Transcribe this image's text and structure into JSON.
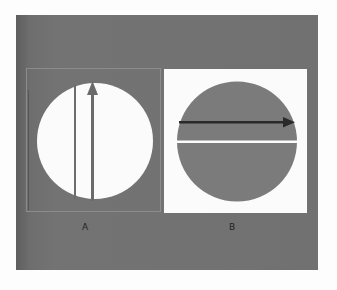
{
  "figure": {
    "colors": {
      "plate": "#6f6f6f",
      "panel_a_circle": "#fbfbfb",
      "panel_b_background": "#fbfbfb",
      "panel_b_circle": "#7a7a7a",
      "arrow_a": "#6a6a6a",
      "arrow_b": "#2a2a2a",
      "divider_b": "#fbfbfb"
    },
    "panels": [
      {
        "label": "A",
        "background": "gray",
        "circle_fill": "white",
        "elements": [
          "vertical line",
          "vertical arrow pointing up"
        ]
      },
      {
        "label": "B",
        "background": "white",
        "circle_fill": "gray",
        "elements": [
          "horizontal arrow pointing right",
          "horizontal white divider line"
        ]
      }
    ]
  },
  "labels": {
    "a": "A",
    "b": "B"
  }
}
